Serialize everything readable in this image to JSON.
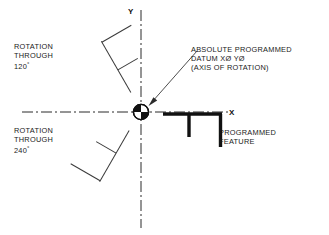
{
  "diagram": {
    "axes": {
      "y_label": "Y",
      "x_label": "X",
      "line_style": "dash-dot centerline",
      "color": "#2b2b2b"
    },
    "datum_symbol": {
      "name": "quadrant-datum-circle",
      "description": "circle with alternating filled quadrants marking axis of rotation",
      "center_x": 141,
      "center_y": 112,
      "radius": 8,
      "fill": "#111111",
      "stroke": "#111111"
    },
    "annotations": {
      "rotation_120": {
        "line1": "ROTATION",
        "line2": "THROUGH",
        "value": "120",
        "degree": "°"
      },
      "rotation_240": {
        "line1": "ROTATION",
        "line2": "THROUGH",
        "value": "240",
        "degree": "°"
      },
      "datum": {
        "line1": "ABSOLUTE PROGRAMMED",
        "line2": "DATUM XØ YØ",
        "line3": "(AXIS OF ROTATION)"
      },
      "programmed_feature": {
        "line1": "PROGRAMMED",
        "line2": "FEATURE"
      }
    },
    "features": {
      "primary": {
        "name": "programmed-feature-0deg",
        "rotation_deg": 0,
        "stroke_width": 3.4,
        "color": "#111111"
      },
      "rotated_120": {
        "name": "programmed-feature-120deg",
        "rotation_deg": 120,
        "stroke_width": 1,
        "color": "#3a3a3a"
      },
      "rotated_240": {
        "name": "programmed-feature-240deg",
        "rotation_deg": 240,
        "stroke_width": 1,
        "color": "#3a3a3a"
      }
    },
    "leader": {
      "name": "datum-leader-arrow",
      "from_x": 196,
      "from_y": 52,
      "to_x": 150,
      "to_y": 104,
      "color": "#3a3a3a"
    }
  }
}
